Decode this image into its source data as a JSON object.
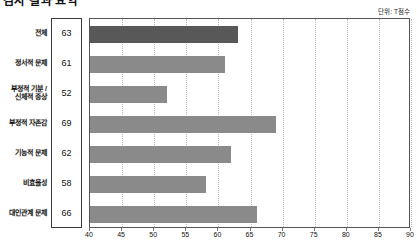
{
  "title": "검사 결과 요약",
  "unit_note": "단위: T점수",
  "chart_data": {
    "type": "bar",
    "orientation": "horizontal",
    "title": "검사 결과 요약",
    "xlabel": "",
    "ylabel": "",
    "unit": "단위: T점수",
    "xlim": [
      40,
      90
    ],
    "xticks": [
      40,
      45,
      50,
      55,
      60,
      65,
      70,
      75,
      80,
      85,
      90
    ],
    "xtick_labels": [
      "40",
      "45",
      "50",
      "55",
      "60",
      "65",
      "70",
      "75",
      "80",
      "85",
      "90"
    ],
    "grid": true,
    "grid_axis": "x",
    "legend": false,
    "categories": [
      "전체",
      "정서적 문제",
      "부정적 기분 /\n신체적 증상",
      "부정적 자존감",
      "기능적 문제",
      "비효율성",
      "대인관계 문제"
    ],
    "category_lines": [
      [
        "전체"
      ],
      [
        "정서적 문제"
      ],
      [
        "부정적 기분 /",
        "신체적 증상"
      ],
      [
        "부정적 자존감"
      ],
      [
        "기능적 문제"
      ],
      [
        "비효율성"
      ],
      [
        "대인관계 문제"
      ]
    ],
    "values": [
      63,
      61,
      52,
      69,
      62,
      58,
      66
    ],
    "bar_colors": [
      "#585858",
      "#8a8a8a",
      "#8a8a8a",
      "#8a8a8a",
      "#8a8a8a",
      "#8a8a8a",
      "#8a8a8a"
    ],
    "highlight_index": 0
  },
  "colors": {
    "bar_default": "#8a8a8a",
    "bar_highlight": "#585858",
    "grid": "#b9b9b9",
    "axis": "#555555",
    "text": "#111111"
  }
}
